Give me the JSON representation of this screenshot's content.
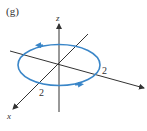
{
  "figure": {
    "panel_label": "(g)",
    "axes": {
      "z_label": "z",
      "x_label": "x"
    },
    "tick_labels": {
      "y_axis_tick": "2",
      "x_axis_tick": "2"
    },
    "circle": {
      "color": "#3a86c8",
      "orientation": "counterclockwise (viewed from above)",
      "radius_label": "2"
    },
    "axis_color": "#333333"
  }
}
